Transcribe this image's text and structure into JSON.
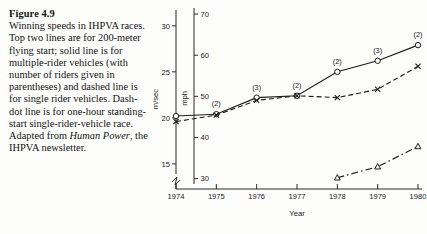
{
  "caption": {
    "figure_number": "Figure 4.9",
    "text": "Winning speeds in IHPVA races. Top two lines are for 200-meter flying start; solid line is for multiple-rider vehicles (with number of riders given in parentheses) and dashed line is for single rider vehicles. Dash-dot line is for one-hour standing-start single-rider-vehicle race. Adapted from ",
    "source_italic": "Human Power",
    "text_tail": ", the IHPVA newsletter."
  },
  "chart_data": {
    "type": "line",
    "title": "",
    "xlabel": "Year",
    "ylabel": "m/sec",
    "y2label": "mph",
    "x": [
      1974,
      1975,
      1976,
      1977,
      1978,
      1979,
      1980
    ],
    "xticklabels": [
      "1974",
      "1975",
      "1976",
      "1977",
      "1978",
      "1979",
      "1980"
    ],
    "ylim": [
      12.6,
      31.5
    ],
    "yticks": [
      15,
      20,
      25,
      30
    ],
    "yticklabels": [
      "15",
      "20",
      "25",
      "30"
    ],
    "y2lim": [
      28.2,
      70.5
    ],
    "y2ticks": [
      30,
      40,
      50,
      60,
      70
    ],
    "y2ticklabels": [
      "30",
      "40",
      "50",
      "60",
      "70"
    ],
    "axis_break": true,
    "grid": false,
    "legend": "none",
    "series": [
      {
        "name": "200-meter flying start, multiple-rider vehicles",
        "style": "solid",
        "marker": "circle",
        "x": [
          1974,
          1975,
          1976,
          1977,
          1978,
          1979,
          1980
        ],
        "values": [
          20.2,
          20.4,
          22.2,
          22.4,
          25.0,
          26.2,
          27.9
        ],
        "point_labels": [
          "",
          "(2)",
          "(3)",
          "(2)",
          "(2)",
          "(3)",
          "(2)"
        ]
      },
      {
        "name": "200-meter flying start, single-rider vehicles",
        "style": "dashed",
        "marker": "x",
        "x": [
          1974,
          1975,
          1976,
          1977,
          1978,
          1979,
          1980
        ],
        "values": [
          19.6,
          20.3,
          21.9,
          22.4,
          22.2,
          23.1,
          25.6
        ],
        "point_labels": [
          "",
          "",
          "",
          "",
          "",
          "",
          ""
        ]
      },
      {
        "name": "One-hour standing-start single-rider-vehicle race",
        "style": "dash-dot",
        "marker": "triangle",
        "x": [
          1978,
          1979,
          1980
        ],
        "values": [
          13.5,
          14.7,
          16.9
        ],
        "point_labels": [
          "",
          "",
          ""
        ]
      }
    ]
  }
}
